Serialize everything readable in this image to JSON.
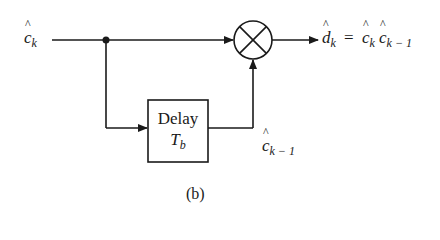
{
  "diagram": {
    "input_label": {
      "base": "c",
      "sub": "k"
    },
    "output_label": {
      "lhs_base": "d",
      "lhs_sub": "k",
      "eq": "=",
      "r1_base": "c",
      "r1_sub": "k",
      "r2_base": "c",
      "r2_sub": "k − 1"
    },
    "delay_block": {
      "line1": "Delay",
      "line2_base": "T",
      "line2_sub": "b"
    },
    "feedback_label": {
      "base": "c",
      "sub": "k − 1"
    },
    "operator": "multiplier",
    "caption": "(b)"
  }
}
